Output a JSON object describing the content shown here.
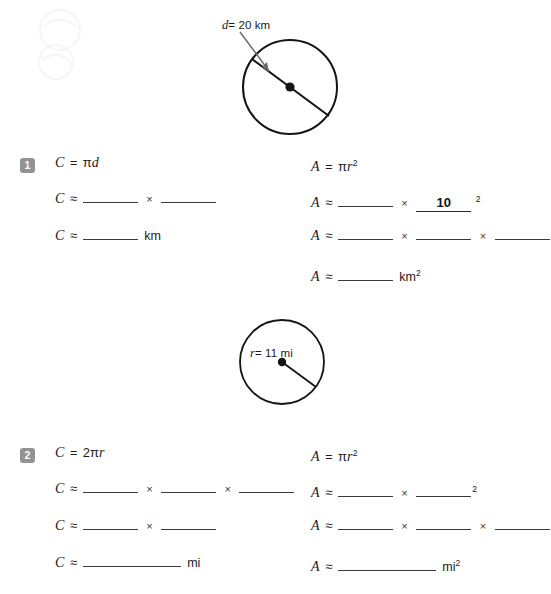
{
  "page": {
    "background_color": "#ffffff",
    "ink_color": "#1a1a1a",
    "badge_color": "#939393"
  },
  "figures": [
    {
      "name": "circle-diameter",
      "label": "d = 20 km",
      "label_variable": "d",
      "label_value": "= 20 km",
      "measure_type": "diameter",
      "value": 20,
      "unit": "km",
      "has_center_dot": true,
      "has_arrow_annotation": true
    },
    {
      "name": "circle-radius",
      "label": "r = 11 mi",
      "label_variable": "r",
      "label_value": "= 11 mi",
      "measure_type": "radius",
      "value": 11,
      "unit": "mi",
      "has_center_dot": true,
      "has_arrow_annotation": false
    }
  ],
  "problems": [
    {
      "number": "1",
      "unit": "km",
      "circumference": {
        "formula_lhs": "C",
        "formula_eq": "=",
        "formula_rhs_pi": "π",
        "formula_rhs_var": "d",
        "rows": [
          {
            "lhs": "C",
            "rel": "≈",
            "cells": [
              {
                "type": "blank",
                "width": "short",
                "value": ""
              },
              {
                "type": "op",
                "value": "×"
              },
              {
                "type": "blank",
                "width": "short",
                "value": ""
              }
            ]
          },
          {
            "lhs": "C",
            "rel": "≈",
            "cells": [
              {
                "type": "blank",
                "width": "short",
                "value": ""
              },
              {
                "type": "unit",
                "value": "km"
              }
            ]
          }
        ]
      },
      "area": {
        "formula_lhs": "A",
        "formula_eq": "=",
        "formula_rhs_pi": "π",
        "formula_rhs_var": "r",
        "formula_rhs_exp": "2",
        "rows": [
          {
            "lhs": "A",
            "rel": "≈",
            "cells": [
              {
                "type": "blank",
                "width": "short",
                "value": ""
              },
              {
                "type": "op",
                "value": "×"
              },
              {
                "type": "blank",
                "width": "short",
                "value": "10",
                "filled": true
              },
              {
                "type": "sup",
                "value": "2"
              }
            ]
          },
          {
            "lhs": "A",
            "rel": "≈",
            "cells": [
              {
                "type": "blank",
                "width": "short",
                "value": ""
              },
              {
                "type": "op",
                "value": "×"
              },
              {
                "type": "blank",
                "width": "short",
                "value": ""
              },
              {
                "type": "op",
                "value": "×"
              },
              {
                "type": "blank",
                "width": "short",
                "value": ""
              }
            ]
          },
          {
            "lhs": "A",
            "rel": "≈",
            "cells": [
              {
                "type": "blank",
                "width": "short",
                "value": ""
              },
              {
                "type": "unit",
                "value": "km"
              },
              {
                "type": "sup",
                "value": "2"
              }
            ]
          }
        ]
      }
    },
    {
      "number": "2",
      "unit": "mi",
      "circumference": {
        "formula_lhs": "C",
        "formula_eq": "=",
        "formula_rhs_coef": "2",
        "formula_rhs_pi": "π",
        "formula_rhs_var": "r",
        "rows": [
          {
            "lhs": "C",
            "rel": "≈",
            "cells": [
              {
                "type": "blank",
                "width": "short",
                "value": ""
              },
              {
                "type": "op",
                "value": "×"
              },
              {
                "type": "blank",
                "width": "short",
                "value": ""
              },
              {
                "type": "op",
                "value": "×"
              },
              {
                "type": "blank",
                "width": "short",
                "value": ""
              }
            ]
          },
          {
            "lhs": "C",
            "rel": "≈",
            "cells": [
              {
                "type": "blank",
                "width": "short",
                "value": ""
              },
              {
                "type": "op",
                "value": "×"
              },
              {
                "type": "blank",
                "width": "short",
                "value": ""
              }
            ]
          },
          {
            "lhs": "C",
            "rel": "≈",
            "cells": [
              {
                "type": "blank",
                "width": "long",
                "value": ""
              },
              {
                "type": "unit",
                "value": "mi"
              }
            ]
          }
        ]
      },
      "area": {
        "formula_lhs": "A",
        "formula_eq": "=",
        "formula_rhs_pi": "π",
        "formula_rhs_var": "r",
        "formula_rhs_exp": "2",
        "rows": [
          {
            "lhs": "A",
            "rel": "≈",
            "cells": [
              {
                "type": "blank",
                "width": "short",
                "value": ""
              },
              {
                "type": "op",
                "value": "×"
              },
              {
                "type": "blank",
                "width": "short",
                "value": ""
              },
              {
                "type": "sup",
                "value": "2"
              }
            ]
          },
          {
            "lhs": "A",
            "rel": "≈",
            "cells": [
              {
                "type": "blank",
                "width": "short",
                "value": ""
              },
              {
                "type": "op",
                "value": "×"
              },
              {
                "type": "blank",
                "width": "short",
                "value": ""
              },
              {
                "type": "op",
                "value": "×"
              },
              {
                "type": "blank",
                "width": "short",
                "value": ""
              }
            ]
          },
          {
            "lhs": "A",
            "rel": "≈",
            "cells": [
              {
                "type": "blank",
                "width": "long",
                "value": ""
              },
              {
                "type": "unit",
                "value": "mi"
              },
              {
                "type": "sup",
                "value": "2"
              }
            ]
          }
        ]
      }
    }
  ],
  "symbols": {
    "times": "×",
    "approx": "≈",
    "equals": "=",
    "pi": "π"
  }
}
